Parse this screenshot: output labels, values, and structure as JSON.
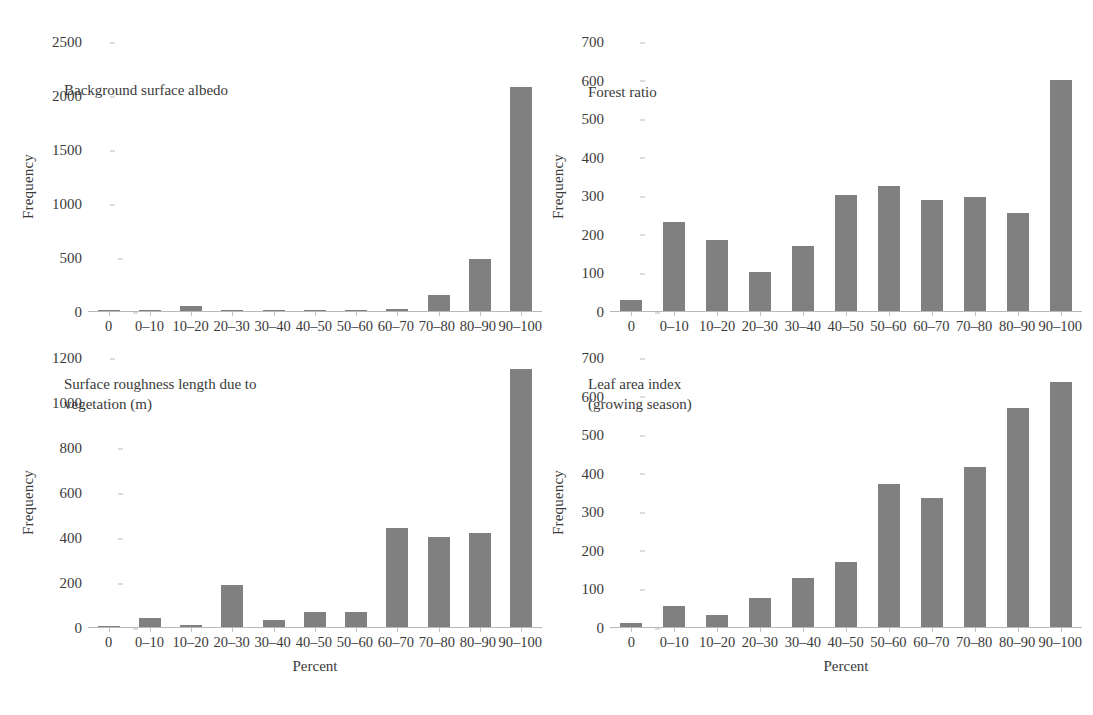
{
  "figure": {
    "background": "#ffffff",
    "bar_color": "#808080",
    "axis_color": "#b9b9b9",
    "text_color": "#3a3a3a"
  },
  "chart_data": [
    {
      "type": "bar",
      "title": "Background surface albedo",
      "xlabel": "",
      "ylabel": "Frequency",
      "categories": [
        "0",
        "0–10",
        "10–20",
        "20–30",
        "30–40",
        "40–50",
        "50–60",
        "60–70",
        "70–80",
        "80–90",
        "90–100"
      ],
      "values": [
        0,
        12,
        45,
        8,
        10,
        0,
        0,
        15,
        150,
        485,
        2070
      ],
      "ylim": [
        0,
        2500
      ],
      "yticks": [
        0,
        500,
        1000,
        1500,
        2000,
        2500
      ],
      "grid": false,
      "legend": "none"
    },
    {
      "type": "bar",
      "title": "Forest ratio",
      "xlabel": "",
      "ylabel": "Frequency",
      "categories": [
        "0",
        "0–10",
        "10–20",
        "20–30",
        "30–40",
        "40–50",
        "50–60",
        "60–70",
        "70–80",
        "80–90",
        "90–100"
      ],
      "values": [
        28,
        232,
        184,
        102,
        168,
        300,
        325,
        288,
        296,
        254,
        600
      ],
      "ylim": [
        0,
        700
      ],
      "yticks": [
        0,
        100,
        200,
        300,
        400,
        500,
        600,
        700
      ],
      "grid": false,
      "legend": "none"
    },
    {
      "type": "bar",
      "title": "Surface roughness length due to\nvegetation (m)",
      "xlabel": "Percent",
      "ylabel": "Frequency",
      "categories": [
        "0",
        "0–10",
        "10–20",
        "20–30",
        "30–40",
        "40–50",
        "50–60",
        "60–70",
        "70–80",
        "80–90",
        "90–100"
      ],
      "values": [
        4,
        40,
        8,
        188,
        32,
        68,
        66,
        440,
        398,
        418,
        1148
      ],
      "ylim": [
        0,
        1200
      ],
      "yticks": [
        0,
        200,
        400,
        600,
        800,
        1000,
        1200
      ],
      "grid": false,
      "legend": "none"
    },
    {
      "type": "bar",
      "title": "Leaf area index\n(growing season)",
      "xlabel": "Percent",
      "ylabel": "Frequency",
      "categories": [
        "0",
        "0–10",
        "10–20",
        "20–30",
        "30–40",
        "40–50",
        "50–60",
        "60–70",
        "70–80",
        "80–90",
        "90–100"
      ],
      "values": [
        10,
        54,
        30,
        74,
        126,
        168,
        370,
        334,
        414,
        568,
        634
      ],
      "ylim": [
        0,
        700
      ],
      "yticks": [
        0,
        100,
        200,
        300,
        400,
        500,
        600,
        700
      ],
      "grid": false,
      "legend": "none"
    }
  ]
}
